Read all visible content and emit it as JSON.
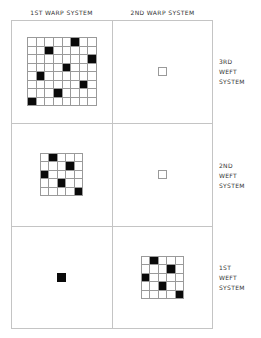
{
  "columns": [
    {
      "label": "1ST WARP SYSTEM"
    },
    {
      "label": "2ND WARP SYSTEM"
    }
  ],
  "rows": [
    {
      "lines": [
        "3RD",
        "WEFT",
        "SYSTEM"
      ]
    },
    {
      "lines": [
        "2ND",
        "WEFT",
        "SYSTEM"
      ]
    },
    {
      "lines": [
        "1ST",
        "WEFT",
        "SYSTEM"
      ]
    }
  ],
  "colors": {
    "filled": "#0a0a0a",
    "grid_line": "#9a9a9a",
    "frame_line": "#c4c4c4",
    "background": "#ffffff"
  },
  "cells": [
    {
      "id": "warp1-weft3",
      "type": "grid",
      "size": 8,
      "filled": [
        [
          0,
          5
        ],
        [
          1,
          2
        ],
        [
          2,
          7
        ],
        [
          3,
          4
        ],
        [
          4,
          1
        ],
        [
          5,
          6
        ],
        [
          6,
          3
        ],
        [
          7,
          0
        ]
      ],
      "box": {
        "left": 27,
        "top": 37,
        "width": 70,
        "height": 69
      }
    },
    {
      "id": "warp2-weft3",
      "type": "single",
      "filled": false,
      "box": {
        "left": 158,
        "top": 67
      }
    },
    {
      "id": "warp1-weft2",
      "type": "grid",
      "size": 5,
      "filled": [
        [
          0,
          1
        ],
        [
          1,
          3
        ],
        [
          2,
          0
        ],
        [
          3,
          2
        ],
        [
          4,
          4
        ]
      ],
      "box": {
        "left": 40,
        "top": 153,
        "width": 43,
        "height": 43
      }
    },
    {
      "id": "warp2-weft2",
      "type": "single",
      "filled": false,
      "box": {
        "left": 158,
        "top": 170
      }
    },
    {
      "id": "warp1-weft1",
      "type": "single",
      "filled": true,
      "box": {
        "left": 57,
        "top": 273
      }
    },
    {
      "id": "warp2-weft1",
      "type": "grid",
      "size": 5,
      "filled": [
        [
          0,
          1
        ],
        [
          1,
          3
        ],
        [
          2,
          0
        ],
        [
          3,
          2
        ],
        [
          4,
          4
        ]
      ],
      "box": {
        "left": 141,
        "top": 256,
        "width": 43,
        "height": 43
      }
    }
  ]
}
